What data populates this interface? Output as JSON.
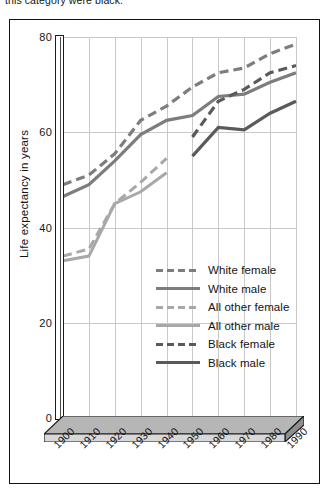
{
  "caption": "this category were black.",
  "chart_data": {
    "type": "line",
    "title": "",
    "xlabel": "",
    "ylabel": "Life expectancy in years",
    "x": [
      1900,
      1910,
      1920,
      1930,
      1940,
      1950,
      1960,
      1970,
      1980,
      1990
    ],
    "xtick_labels": [
      "1900",
      "1910",
      "1920",
      "1930",
      "1940",
      "1950",
      "1960",
      "1970",
      "1980",
      "1990"
    ],
    "ytick_labels": [
      "0",
      "20",
      "40",
      "60",
      "80"
    ],
    "yticks": [
      0,
      20,
      40,
      60,
      80
    ],
    "ylim": [
      0,
      80
    ],
    "xlim": [
      1900,
      1990
    ],
    "grid": "both",
    "legend_position": "center",
    "series": [
      {
        "name": "White female",
        "style": "dashed",
        "color": "#7d7d7d",
        "width": 3.2,
        "x": [
          1900,
          1910,
          1920,
          1930,
          1940,
          1950,
          1960,
          1970,
          1980,
          1990
        ],
        "values": [
          49.0,
          51.0,
          55.5,
          62.5,
          65.5,
          69.5,
          72.5,
          73.5,
          76.5,
          78.5
        ]
      },
      {
        "name": "White male",
        "style": "solid",
        "color": "#7d7d7d",
        "width": 3.2,
        "x": [
          1900,
          1910,
          1920,
          1930,
          1940,
          1950,
          1960,
          1970,
          1980,
          1990
        ],
        "values": [
          46.5,
          49.0,
          54.0,
          59.5,
          62.5,
          63.5,
          67.5,
          68.0,
          70.5,
          72.5
        ]
      },
      {
        "name": "All other female",
        "style": "dashed",
        "color": "#a8a8a8",
        "width": 3.0,
        "x": [
          1900,
          1910,
          1920,
          1930,
          1940
        ],
        "values": [
          34.0,
          35.5,
          45.0,
          49.5,
          54.5
        ]
      },
      {
        "name": "All other male",
        "style": "solid",
        "color": "#a8a8a8",
        "width": 3.0,
        "x": [
          1900,
          1910,
          1920,
          1930,
          1940
        ],
        "values": [
          33.0,
          34.0,
          45.0,
          47.5,
          51.5
        ]
      },
      {
        "name": "Black female",
        "style": "dashed",
        "color": "#5a5a5a",
        "width": 3.2,
        "x": [
          1950,
          1960,
          1970,
          1980,
          1990
        ],
        "values": [
          59.0,
          66.5,
          69.0,
          72.5,
          74.0
        ]
      },
      {
        "name": "Black male",
        "style": "solid",
        "color": "#5a5a5a",
        "width": 3.2,
        "x": [
          1950,
          1960,
          1970,
          1980,
          1990
        ],
        "values": [
          55.0,
          61.0,
          60.5,
          64.0,
          66.5
        ]
      }
    ]
  }
}
